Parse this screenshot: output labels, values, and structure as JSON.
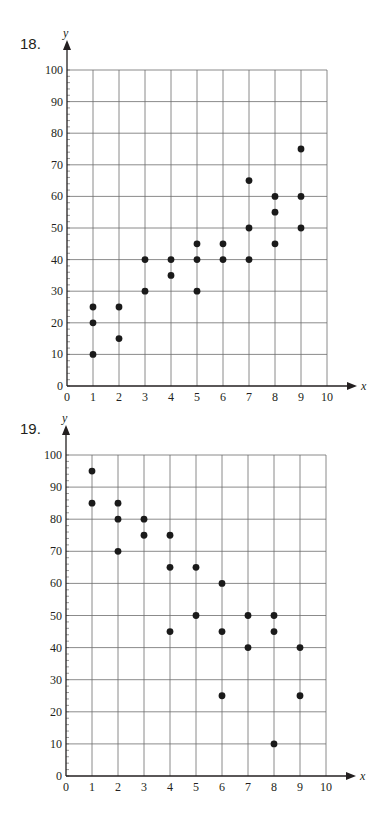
{
  "problems": [
    {
      "number": "18."
    },
    {
      "number": "19."
    }
  ],
  "chart_data": [
    {
      "type": "scatter",
      "title": "18.",
      "xlabel": "x",
      "ylabel": "y",
      "xlim": [
        0,
        10
      ],
      "ylim": [
        0,
        100
      ],
      "xticks": [
        0,
        1,
        2,
        3,
        4,
        5,
        6,
        7,
        8,
        9,
        10
      ],
      "yticks": [
        0,
        10,
        20,
        30,
        40,
        50,
        60,
        70,
        80,
        90,
        100
      ],
      "grid": true,
      "legend": null,
      "points": [
        [
          1,
          25
        ],
        [
          1,
          20
        ],
        [
          1,
          10
        ],
        [
          2,
          25
        ],
        [
          2,
          15
        ],
        [
          3,
          40
        ],
        [
          3,
          30
        ],
        [
          4,
          40
        ],
        [
          4,
          35
        ],
        [
          5,
          45
        ],
        [
          5,
          40
        ],
        [
          5,
          30
        ],
        [
          6,
          45
        ],
        [
          6,
          40
        ],
        [
          7,
          65
        ],
        [
          7,
          50
        ],
        [
          7,
          40
        ],
        [
          8,
          60
        ],
        [
          8,
          55
        ],
        [
          8,
          45
        ],
        [
          9,
          75
        ],
        [
          9,
          60
        ],
        [
          9,
          50
        ]
      ]
    },
    {
      "type": "scatter",
      "title": "19.",
      "xlabel": "x",
      "ylabel": "y",
      "xlim": [
        0,
        10
      ],
      "ylim": [
        0,
        100
      ],
      "xticks": [
        0,
        1,
        2,
        3,
        4,
        5,
        6,
        7,
        8,
        9,
        10
      ],
      "yticks": [
        0,
        10,
        20,
        30,
        40,
        50,
        60,
        70,
        80,
        90,
        100
      ],
      "grid": true,
      "legend": null,
      "points": [
        [
          1,
          95
        ],
        [
          1,
          85
        ],
        [
          2,
          85
        ],
        [
          2,
          80
        ],
        [
          2,
          70
        ],
        [
          3,
          80
        ],
        [
          3,
          75
        ],
        [
          4,
          75
        ],
        [
          4,
          65
        ],
        [
          4,
          45
        ],
        [
          5,
          65
        ],
        [
          5,
          50
        ],
        [
          6,
          60
        ],
        [
          6,
          45
        ],
        [
          6,
          25
        ],
        [
          7,
          50
        ],
        [
          7,
          40
        ],
        [
          8,
          50
        ],
        [
          8,
          45
        ],
        [
          8,
          10
        ],
        [
          9,
          40
        ],
        [
          9,
          25
        ]
      ]
    }
  ]
}
